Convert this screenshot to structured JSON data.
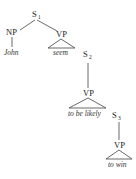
{
  "diagram": {
    "type": "syntax-tree",
    "nodes": {
      "s1": {
        "label": "S",
        "sub": "1"
      },
      "np": {
        "label": "NP"
      },
      "vp1": {
        "label": "VP"
      },
      "s2": {
        "label": "S",
        "sub": "2"
      },
      "vp2": {
        "label": "VP"
      },
      "s3": {
        "label": "S",
        "sub": "3"
      },
      "vp3": {
        "label": "VP"
      }
    },
    "leaves": {
      "john": "John",
      "seem": "seem",
      "to_be_likely": "to be likely",
      "to_win": "to win"
    },
    "edges": [
      [
        "S1",
        "NP"
      ],
      [
        "S1",
        "VP"
      ],
      [
        "NP",
        "John"
      ],
      [
        "VP",
        "seem (triangle)"
      ],
      [
        "S2",
        "VP"
      ],
      [
        "VP",
        "to be likely (triangle)"
      ],
      [
        "S3",
        "VP"
      ],
      [
        "VP",
        "to win (triangle)"
      ]
    ]
  }
}
